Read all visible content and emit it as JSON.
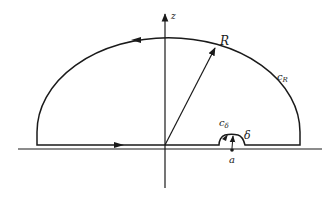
{
  "diagram": {
    "title": "",
    "type": "contour-integration",
    "labels": {
      "axis": "z",
      "radius": "R",
      "large_arc": "c",
      "large_arc_sub": "R",
      "small_arc": "c",
      "small_arc_sub": "δ",
      "small_radius": "δ",
      "point": "a"
    },
    "colors": {
      "line": "#1a1a1a",
      "background": "#ffffff"
    }
  }
}
